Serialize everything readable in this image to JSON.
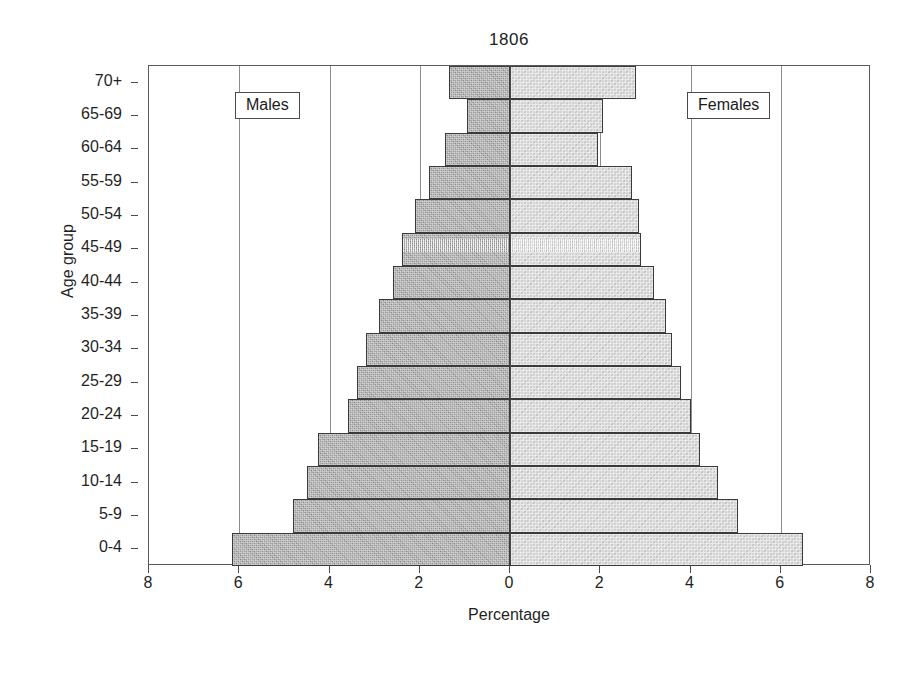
{
  "chart_data": {
    "type": "bar",
    "subtype": "population-pyramid",
    "title": "1806",
    "xlabel": "Percentage",
    "ylabel": "Age group",
    "grid": true,
    "gridlines_x": [
      -8,
      -6,
      -4,
      -2,
      0,
      2,
      4,
      6,
      8
    ],
    "xlim": [
      -8,
      8
    ],
    "xtick_values": [
      -8,
      -6,
      -4,
      -2,
      0,
      2,
      4,
      6,
      8
    ],
    "xtick_labels": [
      "8",
      "6",
      "4",
      "2",
      "0",
      "2",
      "4",
      "6",
      "8"
    ],
    "legend_position": "inside-top-left-and-top-right",
    "categories": [
      "70+",
      "65-69",
      "60-64",
      "55-59",
      "50-54",
      "45-49",
      "40-44",
      "35-39",
      "30-34",
      "25-29",
      "20-24",
      "15-19",
      "10-14",
      "5-9",
      "0-4"
    ],
    "series": [
      {
        "name": "Males",
        "side": "left",
        "color": "#9b9b9b",
        "values": [
          1.35,
          0.95,
          1.45,
          1.8,
          2.1,
          2.4,
          2.6,
          2.9,
          3.2,
          3.4,
          3.6,
          4.25,
          4.5,
          4.8,
          6.15
        ]
      },
      {
        "name": "Females",
        "side": "right",
        "color": "#cfcfcf",
        "values": [
          2.8,
          2.05,
          1.95,
          2.7,
          2.85,
          2.9,
          3.2,
          3.45,
          3.6,
          3.8,
          4.0,
          4.2,
          4.6,
          5.05,
          6.5
        ]
      }
    ]
  },
  "legend": {
    "males": "Males",
    "females": "Females"
  }
}
